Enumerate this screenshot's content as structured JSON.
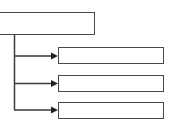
{
  "diagram": {
    "type": "tree",
    "root": {
      "label": ""
    },
    "children": [
      {
        "label": ""
      },
      {
        "label": ""
      },
      {
        "label": ""
      }
    ],
    "colors": {
      "line": "#3a3a3a",
      "box_border": "#4a4a4a",
      "background": "#ffffff"
    }
  }
}
